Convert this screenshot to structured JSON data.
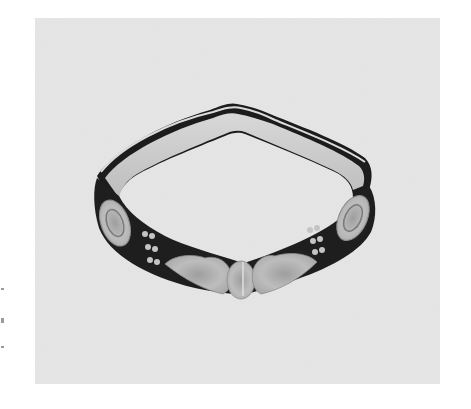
{
  "image": {
    "subject": "beaded headband photograph",
    "description": "Black-and-white photograph of a dark beaded headband/collar with light floral and circular motifs, shown in perspective on a light gray background",
    "colors": {
      "page_background": "#ffffff",
      "photo_background": "#e8e8e8",
      "band_dark": "#1e1e1e",
      "band_inner": "#cfcfcf",
      "motif_light": "#b5b5b5"
    },
    "motifs": [
      "left-oval-rosette",
      "left-bead-cluster",
      "left-heart-leaf",
      "center-oval",
      "right-heart-leaf",
      "right-bead-cluster",
      "right-oval-rosette"
    ]
  }
}
